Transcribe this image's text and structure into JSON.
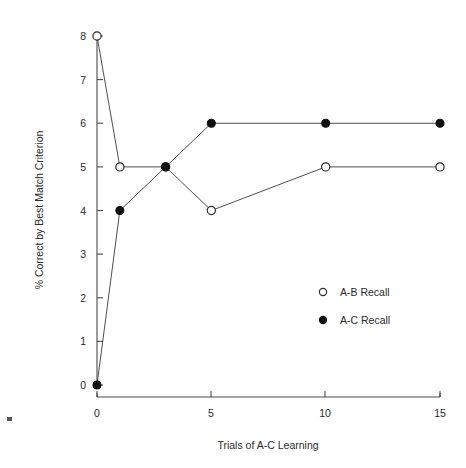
{
  "chart_data": {
    "type": "line",
    "title": "",
    "xlabel": "Trials of A-C Learning",
    "ylabel": "% Correct by Best Match Criterion",
    "x": [
      0,
      1,
      3,
      5,
      10,
      15
    ],
    "xlim": [
      0,
      15
    ],
    "ylim": [
      0,
      8
    ],
    "xticks": [
      0,
      5,
      10,
      15
    ],
    "xticklabels": [
      "0",
      "5",
      "10",
      "15"
    ],
    "yticks": [
      0,
      1,
      2,
      3,
      4,
      5,
      6,
      7,
      8
    ],
    "yticklabels": [
      "0",
      "1",
      "2",
      "3",
      "4",
      "5",
      "6",
      "7",
      "8"
    ],
    "grid": false,
    "legend_position": "center-right-inside",
    "series": [
      {
        "name": "A-B Recall",
        "marker": "open-circle",
        "values": [
          8,
          5,
          5,
          4,
          5,
          5
        ]
      },
      {
        "name": "A-C Recall",
        "marker": "filled-circle",
        "values": [
          0,
          4,
          5,
          6,
          6,
          6
        ]
      }
    ],
    "annotations": []
  },
  "legend": {
    "items": [
      {
        "label": "A-B Recall",
        "marker": "open-circle"
      },
      {
        "label": "A-C Recall",
        "marker": "filled-circle"
      }
    ]
  },
  "axes": {
    "x_title": "Trials of A-C Learning",
    "y_title": "% Correct by Best Match Criterion",
    "x_tick_0": "0",
    "x_tick_1": "5",
    "x_tick_2": "10",
    "x_tick_3": "15",
    "y_tick_0": "0",
    "y_tick_1": "1",
    "y_tick_2": "2",
    "y_tick_3": "3",
    "y_tick_4": "4",
    "y_tick_5": "5",
    "y_tick_6": "6",
    "y_tick_7": "7",
    "y_tick_8": "8"
  }
}
